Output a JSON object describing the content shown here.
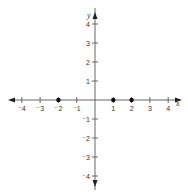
{
  "chart_data": {
    "type": "scatter",
    "title": "",
    "xlabel": "x",
    "ylabel": "y",
    "xlim": [
      -4,
      4
    ],
    "ylim": [
      -4,
      4
    ],
    "grid": false,
    "x_ticks": [
      -4,
      -3,
      -2,
      -1,
      1,
      2,
      3,
      4
    ],
    "y_ticks": [
      4,
      3,
      2,
      1,
      -1,
      -2,
      -3,
      -4
    ],
    "x_tick_labels": [
      "⁻4",
      "⁻3",
      "⁻2",
      "⁻1",
      "1",
      "2",
      "3",
      "4"
    ],
    "y_tick_labels": [
      "4",
      "3",
      "2",
      "1",
      "⁻1",
      "⁻2",
      "⁻3",
      "⁻4"
    ],
    "series": [
      {
        "name": "points",
        "points": [
          {
            "x": -2,
            "y": 0
          },
          {
            "x": 1,
            "y": 0
          },
          {
            "x": 2,
            "y": 0
          }
        ]
      }
    ]
  },
  "colors": {
    "axis": "#666666",
    "point": "#111111",
    "arrow": "#222222"
  }
}
